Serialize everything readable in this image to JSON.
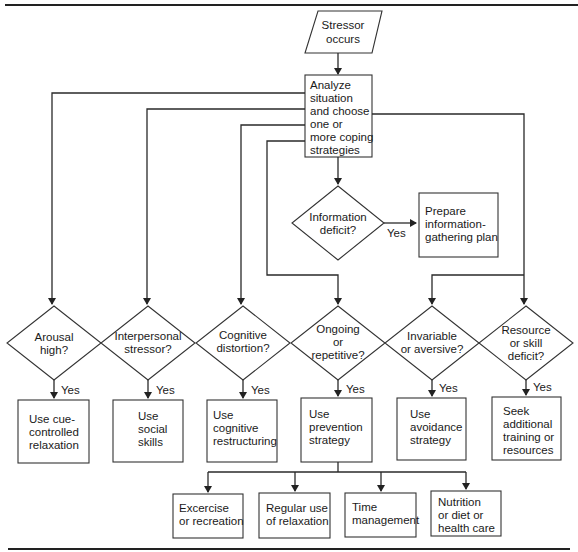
{
  "diagram": {
    "type": "flowchart",
    "start": {
      "lines": [
        "Stressor",
        "occurs"
      ]
    },
    "analyze": {
      "lines": [
        "Analyze",
        "situation",
        "and choose",
        "one or",
        "more coping",
        "strategies"
      ]
    },
    "info_decision": {
      "lines": [
        "Information",
        "deficit?"
      ],
      "yes_label": "Yes"
    },
    "info_action": {
      "lines": [
        "Prepare",
        "information-",
        "gathering plan"
      ]
    },
    "decisions": [
      {
        "lines": [
          "Arousal",
          "high?"
        ],
        "yes_label": "Yes",
        "action": [
          "Use cue-",
          "controlled",
          "relaxation"
        ]
      },
      {
        "lines": [
          "Interpersonal",
          "stressor?"
        ],
        "yes_label": "Yes",
        "action": [
          "Use",
          "social",
          "skills"
        ]
      },
      {
        "lines": [
          "Cognitive",
          "distortion?"
        ],
        "yes_label": "Yes",
        "action": [
          "Use",
          "cognitive",
          "restructuring"
        ]
      },
      {
        "lines": [
          "Ongoing",
          "or",
          "repetitive?"
        ],
        "yes_label": "Yes",
        "action": [
          "Use",
          "prevention",
          "strategy"
        ]
      },
      {
        "lines": [
          "Invariable",
          "or aversive?"
        ],
        "yes_label": "Yes",
        "action": [
          "Use",
          "avoidance",
          "strategy"
        ]
      },
      {
        "lines": [
          "Resource",
          "or skill",
          "deficit?"
        ],
        "yes_label": "Yes",
        "action": [
          "Seek",
          "additional",
          "training or",
          "resources"
        ]
      }
    ],
    "prevention_options": [
      {
        "lines": [
          "Excercise",
          "or recreation"
        ]
      },
      {
        "lines": [
          "Regular use",
          "of relaxation"
        ]
      },
      {
        "lines": [
          "Time",
          "management"
        ]
      },
      {
        "lines": [
          "Nutrition",
          "or diet or",
          "health care"
        ]
      }
    ]
  }
}
